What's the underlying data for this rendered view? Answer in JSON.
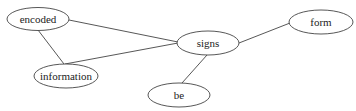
{
  "graph": {
    "type": "undirected-word-graph",
    "nodes": [
      {
        "id": "encoded",
        "label": "encoded",
        "cx": 38,
        "cy": 19,
        "rx": 31,
        "ry": 11.5
      },
      {
        "id": "information",
        "label": "information",
        "cx": 66,
        "cy": 76,
        "rx": 32,
        "ry": 12
      },
      {
        "id": "signs",
        "label": "signs",
        "cx": 208,
        "cy": 43,
        "rx": 31,
        "ry": 12
      },
      {
        "id": "form",
        "label": "form",
        "cx": 321,
        "cy": 22,
        "rx": 32,
        "ry": 12
      },
      {
        "id": "be",
        "label": "be",
        "cx": 179,
        "cy": 95,
        "rx": 31,
        "ry": 12
      }
    ],
    "edges": [
      {
        "from": "encoded",
        "to": "signs",
        "x1": 69,
        "y1": 20,
        "x2": 178,
        "y2": 42
      },
      {
        "from": "encoded",
        "to": "information",
        "x1": 38,
        "y1": 30,
        "x2": 64,
        "y2": 64
      },
      {
        "from": "information",
        "to": "signs",
        "x1": 65,
        "y1": 64,
        "x2": 178,
        "y2": 43
      },
      {
        "from": "signs",
        "to": "form",
        "x1": 239,
        "y1": 43,
        "x2": 290,
        "y2": 23
      },
      {
        "from": "signs",
        "to": "be",
        "x1": 207,
        "y1": 55,
        "x2": 182,
        "y2": 83
      }
    ]
  }
}
